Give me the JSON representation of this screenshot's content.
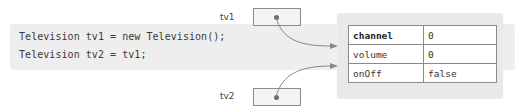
{
  "code": {
    "lines": [
      "Television tv1 = new Television();",
      "Television tv2 = tv1;"
    ]
  },
  "references": [
    {
      "label": "tv1",
      "points_to": "Television object"
    },
    {
      "label": "tv2",
      "points_to": "Television object"
    }
  ],
  "object": {
    "fields": [
      {
        "name": "channel",
        "value": "0"
      },
      {
        "name": "volume",
        "value": "0"
      },
      {
        "name": "onOff",
        "value": "false"
      }
    ]
  },
  "colors": {
    "code_band": "#eeeeee",
    "object_panel": "#e9e9e9",
    "border": "#8a8a8a",
    "arrow": "#888888",
    "dot": "#6a6a6a"
  }
}
